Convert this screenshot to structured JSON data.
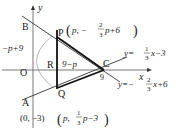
{
  "figure": {
    "axes": {
      "x_label": "x",
      "y_label": "y",
      "origin_label": "O"
    },
    "points": {
      "A": {
        "label": "A",
        "coords_text": "(0, −3)"
      },
      "B": {
        "label": "B"
      },
      "P": {
        "label": "P",
        "coords_prefix": "p, −",
        "frac_num": "2",
        "frac_den": "3",
        "coords_suffix": "p+6"
      },
      "Q": {
        "label": "Q",
        "coords_prefix": "p, ",
        "frac_num": "1",
        "frac_den": "3",
        "coords_suffix": "p−3"
      },
      "R": {
        "label": "R"
      },
      "C": {
        "label": "C"
      }
    },
    "lines": {
      "line1": {
        "lhs": "y=",
        "frac_num": "1",
        "frac_den": "3",
        "rhs": "x−3"
      },
      "line2": {
        "lhs": "y=−",
        "frac_num": "2",
        "frac_den": "3",
        "rhs": "x+6"
      }
    },
    "annotations": {
      "pq_length": "−p+9",
      "rc_length": "9−p",
      "c_x_value": "9"
    },
    "colors": {
      "ink": "#222222",
      "thin_line": "#555555",
      "background": "#ffffff"
    }
  }
}
